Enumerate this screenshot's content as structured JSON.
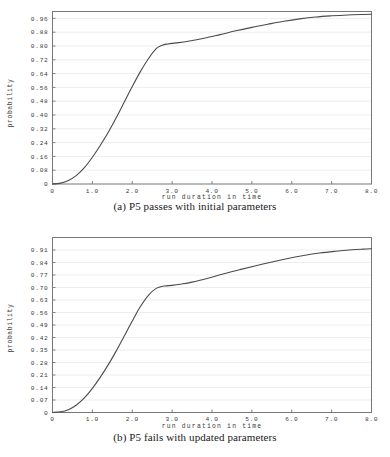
{
  "page": {
    "background_color": "#ffffff",
    "text_color": "#1a1a1a"
  },
  "figure": {
    "subfigures": [
      {
        "id": "a",
        "caption": "(a) P5 passes with initial parameters"
      },
      {
        "id": "b",
        "caption": "(b) P5 fails with updated parameters"
      }
    ]
  },
  "chart_data": [
    {
      "type": "line",
      "title": "",
      "subfigure_label": "(a) P5 passes with initial parameters",
      "xlabel": "run duration in time",
      "ylabel": "probability",
      "xlim": [
        0,
        8.0
      ],
      "ylim": [
        0,
        1.0
      ],
      "xticks": [
        0,
        1.0,
        2.0,
        3.0,
        4.0,
        5.0,
        6.0,
        7.0,
        8.0
      ],
      "xtick_labels": [
        "0",
        "1.0",
        "2.0",
        "3.0",
        "4.0",
        "5.0",
        "6.0",
        "7.0",
        "8.0"
      ],
      "yticks": [
        0,
        0.08,
        0.16,
        0.24,
        0.32,
        0.4,
        0.48,
        0.56,
        0.64,
        0.72,
        0.8,
        0.88,
        0.96
      ],
      "ytick_labels": [
        "0",
        "0.08",
        "0.16",
        "0.24",
        "0.32",
        "0.40",
        "0.48",
        "0.56",
        "0.64",
        "0.72",
        "0.80",
        "0.88",
        "0.96"
      ],
      "grid": true,
      "grid_color": "#e8e8e8",
      "legend": false,
      "line_color": "#4a4a4a",
      "series": [
        {
          "name": "cumulative probability",
          "x": [
            0.0,
            0.2,
            0.4,
            0.6,
            0.8,
            1.0,
            1.2,
            1.4,
            1.6,
            1.8,
            2.0,
            2.2,
            2.4,
            2.6,
            2.75,
            2.9,
            3.1,
            3.4,
            3.8,
            4.2,
            4.6,
            5.0,
            5.4,
            5.8,
            6.2,
            6.6,
            7.0,
            7.4,
            7.8,
            8.0
          ],
          "y": [
            0.0,
            0.005,
            0.02,
            0.05,
            0.095,
            0.155,
            0.225,
            0.3,
            0.385,
            0.475,
            0.565,
            0.65,
            0.725,
            0.785,
            0.805,
            0.812,
            0.818,
            0.828,
            0.845,
            0.866,
            0.888,
            0.908,
            0.926,
            0.943,
            0.957,
            0.968,
            0.975,
            0.98,
            0.983,
            0.984
          ]
        }
      ]
    },
    {
      "type": "line",
      "title": "",
      "subfigure_label": "(b) P5 fails with updated parameters",
      "xlabel": "run duration in time",
      "ylabel": "probability",
      "xlim": [
        0,
        8.0
      ],
      "ylim": [
        0,
        0.98
      ],
      "xticks": [
        0,
        1.0,
        2.0,
        3.0,
        4.0,
        5.0,
        6.0,
        7.0,
        8.0
      ],
      "xtick_labels": [
        "0",
        "1.0",
        "2.0",
        "3.0",
        "4.0",
        "5.0",
        "6.0",
        "7.0",
        "8.0"
      ],
      "yticks": [
        0,
        0.07,
        0.14,
        0.21,
        0.28,
        0.35,
        0.42,
        0.49,
        0.56,
        0.63,
        0.7,
        0.77,
        0.84,
        0.91
      ],
      "ytick_labels": [
        "0",
        "0.07",
        "0.14",
        "0.21",
        "0.28",
        "0.35",
        "0.42",
        "0.49",
        "0.56",
        "0.63",
        "0.70",
        "0.77",
        "0.84",
        "0.91"
      ],
      "grid": true,
      "grid_color": "#e8e8e8",
      "legend": false,
      "line_color": "#4a4a4a",
      "series": [
        {
          "name": "cumulative probability",
          "x": [
            0.0,
            0.2,
            0.4,
            0.6,
            0.8,
            1.0,
            1.2,
            1.4,
            1.6,
            1.8,
            2.0,
            2.2,
            2.4,
            2.6,
            2.8,
            3.0,
            3.2,
            3.5,
            3.9,
            4.3,
            4.7,
            5.1,
            5.5,
            5.9,
            6.3,
            6.7,
            7.1,
            7.5,
            7.8,
            8.0
          ],
          "y": [
            0.0,
            0.004,
            0.016,
            0.042,
            0.082,
            0.135,
            0.198,
            0.268,
            0.345,
            0.428,
            0.512,
            0.592,
            0.655,
            0.695,
            0.708,
            0.712,
            0.718,
            0.73,
            0.752,
            0.777,
            0.8,
            0.822,
            0.843,
            0.862,
            0.879,
            0.893,
            0.903,
            0.911,
            0.915,
            0.917
          ]
        }
      ]
    }
  ]
}
